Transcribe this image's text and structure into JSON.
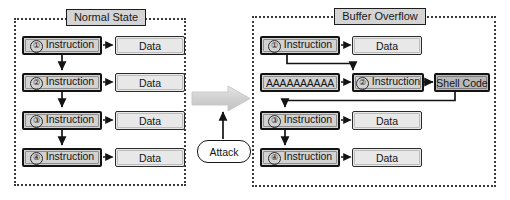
{
  "diagram": {
    "type": "flow-diagram"
  },
  "panels": {
    "left": {
      "title": "Normal State",
      "rows": [
        {
          "num": "①",
          "instruction": "Instruction",
          "data": "Data"
        },
        {
          "num": "②",
          "instruction": "Instruction",
          "data": "Data"
        },
        {
          "num": "③",
          "instruction": "Instruction",
          "data": "Data"
        },
        {
          "num": "④",
          "instruction": "Instruction",
          "data": "Data"
        }
      ]
    },
    "right": {
      "title": "Buffer Overflow",
      "rows": [
        {
          "num": "①",
          "instruction": "Instruction",
          "data": "Data"
        },
        {
          "num": "②",
          "instruction": "Instruction",
          "overflow_payload": "AAAAAAAAAA",
          "shell": "Shell Code"
        },
        {
          "num": "③",
          "instruction": "Instruction",
          "data": "Data"
        },
        {
          "num": "④",
          "instruction": "Instruction",
          "data": "Data"
        }
      ]
    }
  },
  "middle": {
    "attack_label": "Attack",
    "transition_arrow": "right-block-arrow"
  },
  "colors": {
    "instruction_fill": "#d2d2d2",
    "data_fill": "#e8e8e8",
    "shell_fill": "#b9b9b9",
    "title_fill": "#d4d4d4",
    "block_arrow_fill": "#d9d9d9",
    "stroke": "#131313",
    "panel_border": "#3a3a3a"
  }
}
